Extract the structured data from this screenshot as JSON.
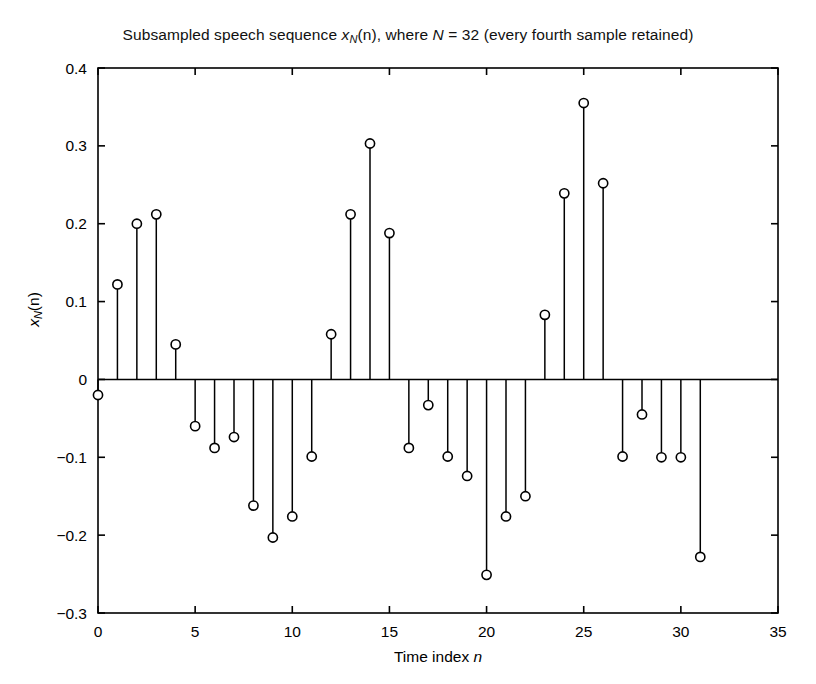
{
  "chart_data": {
    "type": "stem",
    "title_plain": "Subsampled speech sequence x_N(n), where N = 32 (every fourth sample retained)",
    "title_parts": {
      "pre": "Subsampled speech sequence ",
      "var": "x",
      "var_sub": "N",
      "mid": "(n), where ",
      "var2": "N",
      "post": " = 32 (every fourth sample retained)"
    },
    "xlabel_parts": {
      "pre": "Time index ",
      "var": "n"
    },
    "ylabel_parts": {
      "var": "x",
      "var_sub": "N",
      "post": "(n)"
    },
    "xlabel": "Time index n",
    "ylabel": "x_N(n)",
    "xlim": [
      0,
      35
    ],
    "ylim": [
      -0.3,
      0.4
    ],
    "xticks": [
      0,
      5,
      10,
      15,
      20,
      25,
      30,
      35
    ],
    "xticklabels": [
      "0",
      "5",
      "10",
      "15",
      "20",
      "25",
      "30",
      "35"
    ],
    "yticks": [
      -0.3,
      -0.2,
      -0.1,
      0,
      0.1,
      0.2,
      0.3,
      0.4
    ],
    "yticklabels": [
      "-0.3",
      "-0.2",
      "-0.1",
      "0",
      "0.1",
      "0.2",
      "0.3",
      "0.4"
    ],
    "grid": false,
    "legend": false,
    "marker": "open-circle",
    "marker_color": "#000000",
    "stem_color": "#000000",
    "baseline_value": 0,
    "x": [
      0,
      1,
      2,
      3,
      4,
      5,
      6,
      7,
      8,
      9,
      10,
      11,
      12,
      13,
      14,
      15,
      16,
      17,
      18,
      19,
      20,
      21,
      22,
      23,
      24,
      25,
      26,
      27,
      28,
      29,
      30,
      31
    ],
    "values": [
      -0.02,
      0.122,
      0.2,
      0.212,
      0.045,
      -0.06,
      -0.088,
      -0.074,
      -0.162,
      -0.203,
      -0.176,
      -0.099,
      0.058,
      0.212,
      0.303,
      0.188,
      -0.088,
      -0.033,
      -0.099,
      -0.124,
      -0.251,
      -0.176,
      -0.15,
      0.083,
      0.239,
      0.355,
      0.252,
      -0.099,
      -0.045,
      -0.1,
      -0.1,
      -0.228
    ]
  },
  "figure": {
    "background": "#ffffff",
    "axis_color": "#000000"
  }
}
